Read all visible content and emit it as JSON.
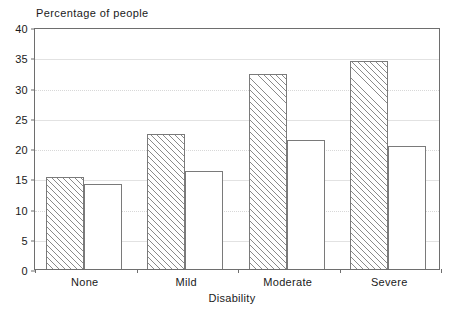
{
  "chart_data": {
    "type": "bar",
    "title": "Percentage of people",
    "xlabel": "Disability",
    "ylabel": "Percentage of people",
    "categories": [
      "None",
      "Mild",
      "Moderate",
      "Severe"
    ],
    "series": [
      {
        "name": "hatched",
        "style": "diagonal-hatch",
        "values": [
          15.2,
          22.3,
          32.3,
          34.4
        ]
      },
      {
        "name": "open",
        "style": "unfilled",
        "values": [
          14.0,
          16.2,
          21.3,
          20.3
        ]
      }
    ],
    "ylim": [
      0,
      40
    ],
    "ytick_step": 5,
    "yticks": [
      "0",
      "5",
      "10",
      "15",
      "20",
      "25",
      "30",
      "35",
      "40"
    ],
    "grid": "horizontal-dotted",
    "legend": "none",
    "frame": "box",
    "colors": {
      "axis": "#6e6e6e",
      "grid": "#d8d8d8",
      "bar_outline": "#7a7a7a",
      "hatch": "#8a8a8a",
      "background": "#ffffff",
      "text": "#1a1a1a"
    }
  }
}
